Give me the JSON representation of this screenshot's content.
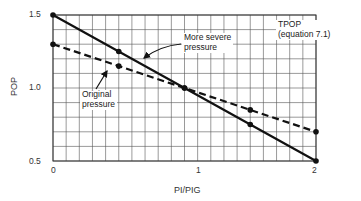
{
  "chart_data": {
    "type": "line",
    "title": "",
    "xlabel": "PI/PIG",
    "ylabel": "POP",
    "xlim": [
      0,
      2
    ],
    "ylim": [
      0.5,
      1.5
    ],
    "x_ticks": [
      "0",
      "1",
      "2"
    ],
    "y_ticks": [
      "0.5",
      "1.0",
      "1.5"
    ],
    "grid": true,
    "grid_step_x": 0.1,
    "grid_step_y": 0.1,
    "x": [
      0,
      0.5,
      1.0,
      1.5,
      2.0
    ],
    "series": [
      {
        "name": "More severe pressure",
        "style": "solid",
        "values": [
          1.5,
          1.25,
          1.0,
          0.75,
          0.5
        ]
      },
      {
        "name": "Original pressure",
        "style": "dashed",
        "values": [
          1.3,
          1.15,
          1.0,
          0.85,
          0.7
        ]
      }
    ],
    "annotations": [
      {
        "text": "More severe\npressure",
        "points_to_series": "More severe pressure"
      },
      {
        "text": "Original\npressure",
        "points_to_series": "Original pressure"
      },
      {
        "text": "TPOP\n(equation 7.1)"
      }
    ]
  },
  "labels": {
    "xlabel": "PI/PIG",
    "ylabel": "POP",
    "x0": "0",
    "x1": "1",
    "x2": "2",
    "y05": "0.5",
    "y10": "1.0",
    "y15": "1.5",
    "severe_line1": "More severe",
    "severe_line2": "pressure",
    "orig_line1": "Original",
    "orig_line2": "pressure",
    "tpop_line1": "TPOP",
    "tpop_line2": "(equation 7.1)"
  }
}
